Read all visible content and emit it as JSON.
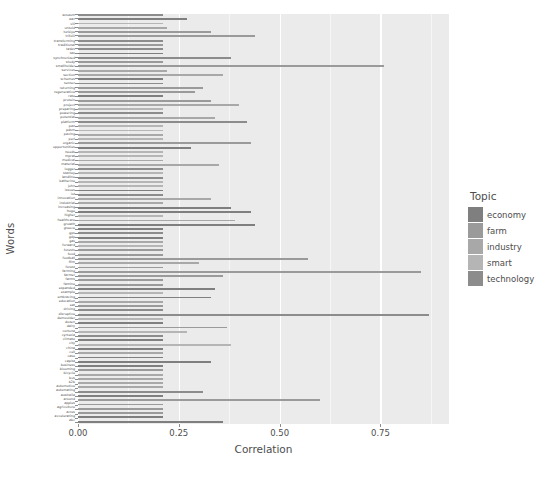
{
  "chart_data": {
    "type": "bar",
    "orientation": "horizontal",
    "title": "",
    "xlabel": "Correlation",
    "ylabel": "Words",
    "xlim": [
      0.0,
      0.92
    ],
    "xticks": [
      0.0,
      0.25,
      0.5,
      0.75
    ],
    "xticklabels": [
      "0.00",
      "0.25",
      "0.50",
      "0.75"
    ],
    "grid": true,
    "legend": {
      "title": "Topic",
      "position": "right",
      "entries": [
        {
          "label": "economy",
          "color": "#7f7f7f"
        },
        {
          "label": "farm",
          "color": "#9a9a9a"
        },
        {
          "label": "industry",
          "color": "#a8a8a8"
        },
        {
          "label": "smart",
          "color": "#b5b5b5"
        },
        {
          "label": "technology",
          "color": "#8c8c8c"
        }
      ]
    },
    "categories": [
      "wisdom",
      "war",
      "vili",
      "untold",
      "turkiye",
      "trifolii",
      "transforming",
      "traditional",
      "tasks",
      "tax",
      "synchronized",
      "study",
      "smallholder",
      "services",
      "section",
      "schemes",
      "sensor",
      "returning",
      "regenerative",
      "rate",
      "protein",
      "project",
      "preparing",
      "powering",
      "potential",
      "platform",
      "pan",
      "pdsm",
      "paving",
      "perl",
      "organic",
      "opportunities",
      "needs",
      "mprat",
      "medical",
      "material",
      "logger",
      "stanley",
      "landline",
      "katherine",
      "john",
      "issues",
      "iot",
      "innovation",
      "industrial",
      "increasing",
      "huge",
      "higher",
      "healthcare",
      "growth",
      "greece",
      "gps",
      "gdp",
      "gas",
      "forward",
      "forests",
      "food",
      "football",
      "film",
      "forest",
      "farming",
      "farmer",
      "farms",
      "famine",
      "expanded",
      "example",
      "embracing",
      "education",
      "eat",
      "driving",
      "disruptive",
      "demoulder",
      "dozen",
      "dairy",
      "cortona",
      "cyrtexia",
      "climate",
      "city",
      "china",
      "cell",
      "case",
      "capita",
      "business",
      "blooming",
      "bicycle",
      "bus",
      "b2b",
      "automotive",
      "automating",
      "australia",
      "around",
      "apples",
      "agriculture",
      "acres",
      "accelerating",
      "abc"
    ],
    "values": [
      0.21,
      0.27,
      0.21,
      0.22,
      0.33,
      0.44,
      0.21,
      0.21,
      0.21,
      0.21,
      0.38,
      0.21,
      0.76,
      0.22,
      0.36,
      0.21,
      0.21,
      0.31,
      0.29,
      0.21,
      0.33,
      0.4,
      0.21,
      0.21,
      0.34,
      0.42,
      0.21,
      0.21,
      0.21,
      0.21,
      0.43,
      0.28,
      0.21,
      0.21,
      0.21,
      0.35,
      0.21,
      0.21,
      0.21,
      0.21,
      0.21,
      0.21,
      0.21,
      0.33,
      0.21,
      0.38,
      0.43,
      0.21,
      0.39,
      0.44,
      0.21,
      0.21,
      0.21,
      0.21,
      0.21,
      0.21,
      0.21,
      0.57,
      0.3,
      0.21,
      0.85,
      0.36,
      0.21,
      0.21,
      0.34,
      0.21,
      0.33,
      0.21,
      0.21,
      0.21,
      0.87,
      0.21,
      0.21,
      0.37,
      0.27,
      0.21,
      0.21,
      0.38,
      0.21,
      0.21,
      0.21,
      0.33,
      0.21,
      0.21,
      0.21,
      0.21,
      0.21,
      0.21,
      0.31,
      0.21,
      0.6,
      0.21,
      0.21,
      0.21,
      0.21,
      0.36
    ],
    "topics": [
      "technology",
      "economy",
      "smart",
      "industry",
      "farm",
      "farm",
      "technology",
      "farm",
      "technology",
      "economy",
      "technology",
      "farm",
      "farm",
      "industry",
      "industry",
      "economy",
      "technology",
      "farm",
      "farm",
      "economy",
      "farm",
      "industry",
      "smart",
      "technology",
      "industry",
      "technology",
      "smart",
      "smart",
      "industry",
      "smart",
      "farm",
      "economy",
      "smart",
      "smart",
      "industry",
      "industry",
      "technology",
      "smart",
      "technology",
      "smart",
      "smart",
      "economy",
      "technology",
      "industry",
      "industry",
      "economy",
      "economy",
      "smart",
      "industry",
      "economy",
      "economy",
      "technology",
      "economy",
      "industry",
      "smart",
      "farm",
      "farm",
      "farm",
      "industry",
      "farm",
      "farm",
      "farm",
      "farm",
      "farm",
      "economy",
      "smart",
      "economy",
      "industry",
      "farm",
      "technology",
      "technology",
      "smart",
      "economy",
      "farm",
      "smart",
      "technology",
      "economy",
      "smart",
      "economy",
      "industry",
      "economy",
      "economy",
      "economy",
      "farm",
      "industry",
      "industry",
      "industry",
      "industry",
      "technology",
      "economy",
      "farm",
      "farm",
      "farm",
      "farm",
      "economy",
      "economy"
    ]
  }
}
